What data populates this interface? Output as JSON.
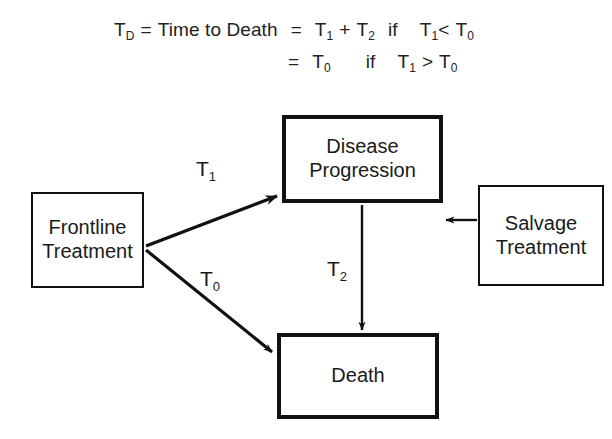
{
  "figure": {
    "type": "flow-diagram",
    "title_formula": {
      "line1": {
        "lhs_symbol": "T",
        "lhs_sub": "D",
        "equals_1": "=",
        "definition": "Time to Death",
        "equals_2": "=",
        "term_1_symbol": "T",
        "term_1_sub": "1",
        "plus": "+",
        "term_2_symbol": "T",
        "term_2_sub": "2",
        "condition_word": "if",
        "cond_left_symbol": "T",
        "cond_left_sub": "1",
        "cond_operator": "<",
        "cond_right_symbol": "T",
        "cond_right_sub": "0",
        "plain_text": "T_D = Time to Death = T_1 + T_2 if T_1 < T_0"
      },
      "line2": {
        "equals": "=",
        "value_symbol": "T",
        "value_sub": "0",
        "condition_word": "if",
        "cond_left_symbol": "T",
        "cond_left_sub": "1",
        "cond_operator": ">",
        "cond_right_symbol": "T",
        "cond_right_sub": "0",
        "plain_text": "= T_0 if T_1 > T_0"
      }
    },
    "nodes": [
      {
        "id": "frontline",
        "line1": "Frontline",
        "line2": "Treatment",
        "border": "thin"
      },
      {
        "id": "disease",
        "line1": "Disease",
        "line2": "Progression",
        "border": "thick"
      },
      {
        "id": "salvage",
        "line1": "Salvage",
        "line2": "Treatment",
        "border": "thin"
      },
      {
        "id": "death",
        "line1": "Death",
        "line2": "",
        "border": "thick"
      }
    ],
    "edges": [
      {
        "id": "t1",
        "from": "frontline",
        "to": "disease",
        "label_symbol": "T",
        "label_sub": "1",
        "label": "T1",
        "direction": "up-right"
      },
      {
        "id": "t0",
        "from": "frontline",
        "to": "death",
        "label_symbol": "T",
        "label_sub": "0",
        "label": "T0",
        "direction": "down-right"
      },
      {
        "id": "t2",
        "from": "disease",
        "to": "death",
        "label_symbol": "T",
        "label_sub": "2",
        "label": "T2",
        "direction": "down"
      },
      {
        "id": "salvage-edge",
        "from": "salvage",
        "to": "disease",
        "label_symbol": "",
        "label_sub": "",
        "label": "",
        "direction": "left"
      }
    ],
    "colors": {
      "stroke": "#111111",
      "text": "#1a1a1a",
      "background": "#ffffff"
    }
  }
}
